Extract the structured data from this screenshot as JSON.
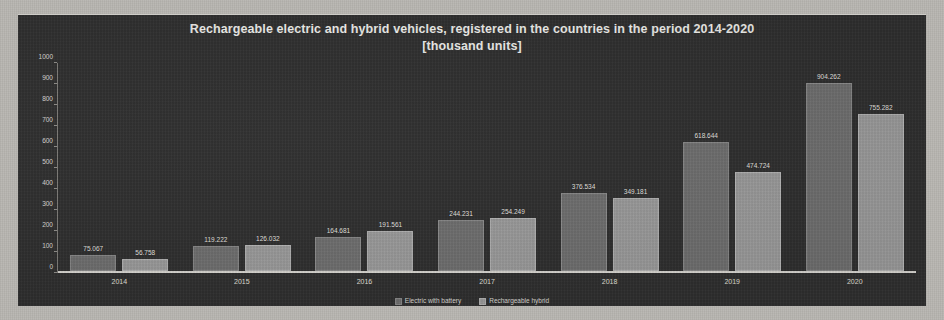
{
  "chart_data": {
    "type": "bar",
    "title": "Rechargeable electric and hybrid vehicles, registered in the countries in the period 2014-2020",
    "subtitle": "[thousand units]",
    "xlabel": "",
    "ylabel": "",
    "ylim": [
      0,
      1000
    ],
    "ytick_step": 100,
    "yticks": [
      "1000",
      "900",
      "800",
      "700",
      "600",
      "500",
      "400",
      "300",
      "200",
      "100",
      "0"
    ],
    "grid": false,
    "legend_position": "bottom",
    "categories": [
      "2014",
      "2015",
      "2016",
      "2017",
      "2018",
      "2019",
      "2020"
    ],
    "series": [
      {
        "name": "Electric with battery",
        "color": "#6f6f6f",
        "values": [
          75.067,
          119.222,
          164.681,
          244.231,
          376.534,
          618.644,
          904.262
        ],
        "labels": [
          "75.067",
          "119.222",
          "164.681",
          "244.231",
          "376.534",
          "618.644",
          "904.262"
        ]
      },
      {
        "name": "Rechargeable hybrid",
        "color": "#9b9b9b",
        "values": [
          56.758,
          126.032,
          191.561,
          254.249,
          349.181,
          474.724,
          755.282
        ],
        "labels": [
          "56.758",
          "126.032",
          "191.561",
          "254.249",
          "349.181",
          "474.724",
          "755.282"
        ]
      }
    ]
  },
  "colors": {
    "panel_background": "#2f2f2f",
    "page_background": "#b8b6b1",
    "series_1": "#6f6f6f",
    "series_2": "#9b9b9b",
    "text": "#efedea"
  }
}
